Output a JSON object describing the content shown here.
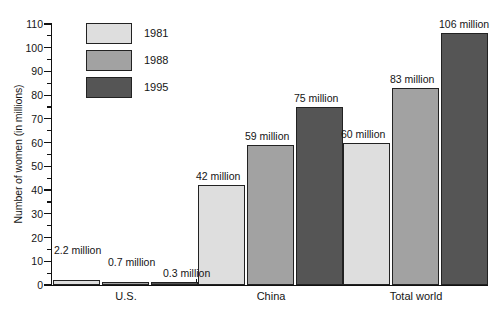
{
  "chart_data": {
    "type": "bar",
    "title": "",
    "xlabel": "",
    "ylabel": "Number of women (in millions)",
    "ylim": [
      0,
      110
    ],
    "y_major_step": 10,
    "y_minor_step": 5,
    "grid": false,
    "legend_position": "upper-left-inside",
    "categories": [
      "U.S.",
      "China",
      "Total world"
    ],
    "series": [
      {
        "name": "1981",
        "color": "#dedede",
        "values": [
          2.2,
          42,
          60
        ],
        "labels": [
          "2.2 million",
          "42 million",
          "60 million"
        ]
      },
      {
        "name": "1988",
        "color": "#a2a2a2",
        "values": [
          0.7,
          59,
          83
        ],
        "labels": [
          "0.7 million",
          "59 million",
          "83 million"
        ]
      },
      {
        "name": "1995",
        "color": "#555555",
        "values": [
          0.3,
          75,
          106
        ],
        "labels": [
          "0.3 million",
          "75 million",
          "106 million"
        ]
      }
    ],
    "y_tick_labels": [
      "0",
      "10",
      "20",
      "30",
      "40",
      "50",
      "60",
      "70",
      "80",
      "90",
      "100",
      "110"
    ]
  },
  "axis": {
    "y_title": "Number of women (in millions)"
  },
  "legend": {
    "items": [
      {
        "label": "1981",
        "color": "#dedede"
      },
      {
        "label": "1988",
        "color": "#a2a2a2"
      },
      {
        "label": "1995",
        "color": "#555555"
      }
    ]
  },
  "categories": [
    {
      "label": "U.S."
    },
    {
      "label": "China"
    },
    {
      "label": "Total world"
    }
  ],
  "bars": [
    {
      "group": "U.S.",
      "series": "1981",
      "value": 2.2,
      "label": "2.2 million"
    },
    {
      "group": "U.S.",
      "series": "1988",
      "value": 0.7,
      "label": "0.7 million"
    },
    {
      "group": "U.S.",
      "series": "1995",
      "value": 0.3,
      "label": "0.3 million"
    },
    {
      "group": "China",
      "series": "1981",
      "value": 42,
      "label": "42 million"
    },
    {
      "group": "China",
      "series": "1988",
      "value": 59,
      "label": "59 million"
    },
    {
      "group": "China",
      "series": "1995",
      "value": 75,
      "label": "75 million"
    },
    {
      "group": "Total world",
      "series": "1981",
      "value": 60,
      "label": "60 million"
    },
    {
      "group": "Total world",
      "series": "1988",
      "value": 83,
      "label": "83 million"
    },
    {
      "group": "Total world",
      "series": "1995",
      "value": 106,
      "label": "106 million"
    }
  ]
}
